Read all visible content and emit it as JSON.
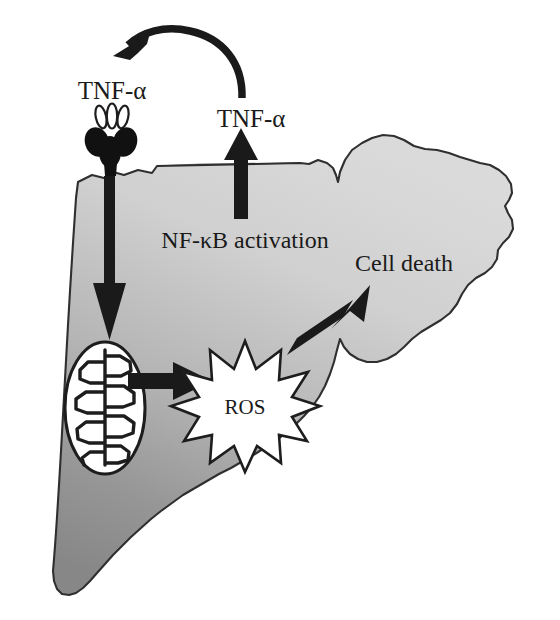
{
  "figure": {
    "background_color": "#ffffff"
  },
  "colors": {
    "cell_fill_light": "#d2d2d2",
    "cell_fill_dark": "#8a8a8a",
    "outline": "#2b2b2b",
    "arrow": "#1a1a1a",
    "organelle_fill": "#ffffff",
    "text": "#1a1a1a",
    "receptor_fill": "#111111"
  },
  "labels": {
    "tnf_extracellular": "TNF-α",
    "tnf_secreted": "TNF-α",
    "nfkb_activation": "NF-κB activation",
    "cell_death": "Cell death",
    "ros": "ROS"
  },
  "shapes": {
    "cell_body": "hepatocyte-cell-outline",
    "mitochondrion": "mitochondrion-with-cristae",
    "ros_burst": "ten-point-starburst",
    "tnf_ligand": "tnf-ligand-trimer-ovals",
    "tnf_receptor": "tnf-receptor-cluster"
  },
  "arrows": [
    {
      "name": "feedback-curve-arrow",
      "from": "tnf_secreted",
      "to": "tnf_extracellular",
      "style": "curved",
      "direction": "right-to-left"
    },
    {
      "name": "receptor-to-mitochondrion-arrow",
      "from": "tnf_receptor",
      "to": "mitochondrion",
      "style": "straight-thin",
      "direction": "down"
    },
    {
      "name": "nfkb-to-tnf-secretion-arrow",
      "from": "nfkb_activation",
      "to": "tnf_secreted",
      "style": "straight-thick",
      "direction": "up"
    },
    {
      "name": "mitochondrion-to-ros-arrow",
      "from": "mitochondrion",
      "to": "ros",
      "style": "straight-thick",
      "direction": "right"
    },
    {
      "name": "ros-to-cell-death-arrow",
      "from": "ros",
      "to": "cell_death",
      "style": "straight-thick",
      "direction": "up-right"
    }
  ]
}
